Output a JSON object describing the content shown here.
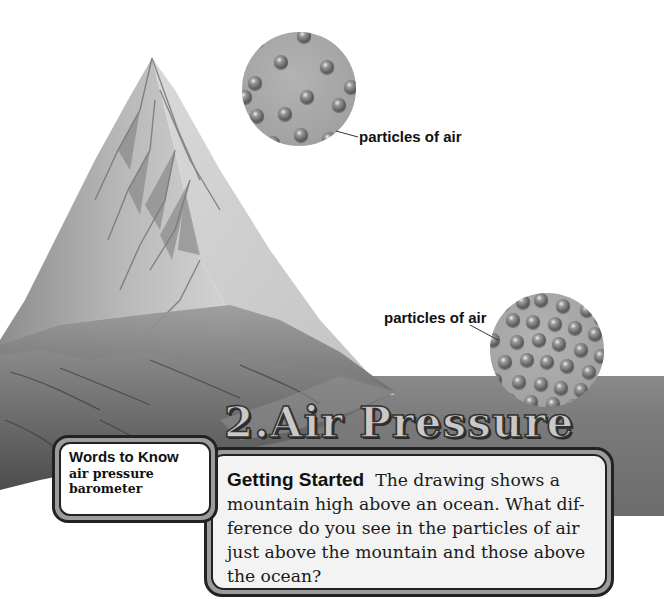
{
  "lesson": {
    "number": "2.",
    "title": "Air Pressure"
  },
  "illustration": {
    "subject": "mountain-above-ocean",
    "top_circle": {
      "label": "particles of air",
      "particle_count": 14,
      "density": "sparse"
    },
    "bottom_circle": {
      "label": "particles of air",
      "particle_count": 32,
      "density": "dense"
    }
  },
  "words_to_know": {
    "heading": "Words to Know",
    "terms": [
      "air pressure",
      "barometer"
    ]
  },
  "getting_started": {
    "heading": "Getting Started",
    "body": "The drawing shows a mountain high above an ocean. What difference do you see in the particles of air just above the mountain and those above the ocean?",
    "lines": [
      "The drawing shows a",
      "mountain high above an ocean. What dif-",
      "ference do you see in the particles of air",
      "just above the mountain and those above",
      "the ocean?"
    ]
  },
  "colors": {
    "ocean_band": "#7b7b7b",
    "circle_fill": "#a8a8a8",
    "box_frame": "#9c9c9c",
    "box_fill": "#f3f3f3",
    "title_fill": "#c9c9c9",
    "ink": "#111111"
  }
}
